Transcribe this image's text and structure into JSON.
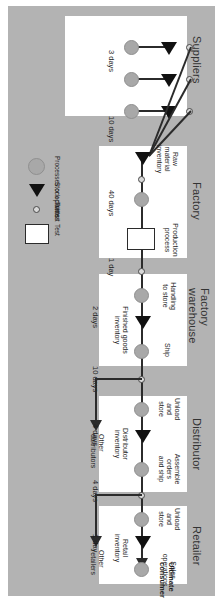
{
  "diagram": {
    "orientation": "rotated-90",
    "plate_color": "#b3b3b3",
    "box_color": "#ffffff",
    "line_color": "#2b2b2b",
    "stock_color": "#a8a8a8"
  },
  "endpoint": {
    "label": "Ultimate\nconsumer"
  },
  "stages": [
    {
      "id": "retailer",
      "title": "Retailer",
      "nodes": [
        {
          "name": "Unload\nand\nstore",
          "glyph": "stock-point"
        },
        {
          "name": "Sales\noperations",
          "glyph": "stock-point"
        }
      ],
      "inventory": "Retail\ninventory",
      "lead_times": [
        "1 day"
      ]
    },
    {
      "id": "distributor",
      "title": "Distributor",
      "nodes": [
        {
          "name": "Unload\nand\nstore",
          "glyph": "stock-point"
        },
        {
          "name": "Assemble\norders\nand ship",
          "glyph": "stock-point"
        }
      ],
      "inventory": "Distributor\ninventory",
      "lead_times": [
        "4 days",
        "4 days"
      ]
    },
    {
      "id": "factory-warehouse",
      "title": "Factory\nwarehouse",
      "nodes": [
        {
          "name": "Handling\nto store",
          "glyph": "stock-point"
        },
        {
          "name": "Ship",
          "glyph": "stock-point"
        }
      ],
      "inventory": "Finished goods\ninventory",
      "lead_times": [
        "2 days",
        "10 days"
      ]
    },
    {
      "id": "factory",
      "title": "Factory",
      "nodes": [
        {
          "name": "Production\nprocess",
          "glyph": "test-box"
        }
      ],
      "inventory": "Raw\nmaterial\ninventory",
      "lead_times": [
        "1 day",
        "40 days"
      ]
    },
    {
      "id": "suppliers",
      "title": "Suppliers",
      "nodes": [
        {
          "name": "",
          "glyph": "stock-point"
        },
        {
          "name": "",
          "glyph": "stock-point"
        },
        {
          "name": "",
          "glyph": "stock-point"
        }
      ],
      "inventory": "",
      "lead_times": [
        "10 days",
        "3 days"
      ]
    }
  ],
  "branches": [
    {
      "label": "Other\nretailers"
    },
    {
      "label": "Other\ndistributors"
    }
  ],
  "legend": {
    "items": [
      {
        "label": "Processes or activities",
        "glyph": "circle"
      },
      {
        "label": "Stock points",
        "glyph": "triangle"
      },
      {
        "label": "Transit",
        "glyph": "small-circle"
      },
      {
        "label": "Test",
        "glyph": "rectangle"
      }
    ]
  }
}
